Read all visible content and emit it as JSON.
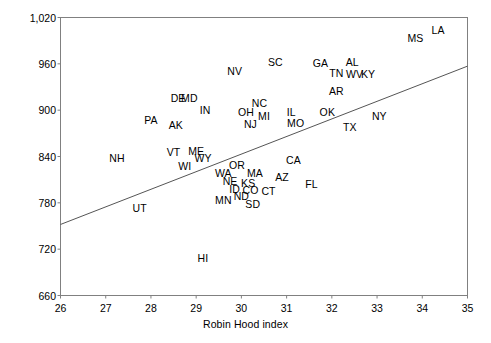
{
  "chart_data": {
    "type": "scatter",
    "title": "",
    "xlabel": "Robin Hood index",
    "ylabel": "Age-adjusted mortality rate",
    "xlim": [
      26,
      35
    ],
    "ylim": [
      660,
      1020
    ],
    "xticks": [
      26,
      27,
      28,
      29,
      30,
      31,
      32,
      33,
      34,
      35
    ],
    "yticks": [
      "660",
      "720",
      "780",
      "840",
      "900",
      "960",
      "1,020"
    ],
    "ytick_values": [
      660,
      720,
      780,
      840,
      900,
      960,
      1020
    ],
    "grid": false,
    "legend": null,
    "point_marker": "text-label",
    "trendline": {
      "visible": true,
      "x_start": 26,
      "y_start": 752,
      "x_end": 35,
      "y_end": 957,
      "color": "#555555"
    },
    "points": [
      {
        "label": "LA",
        "x": 34.35,
        "y": 1004
      },
      {
        "label": "MS",
        "x": 33.85,
        "y": 994
      },
      {
        "label": "AL",
        "x": 32.45,
        "y": 963
      },
      {
        "label": "NV",
        "x": 29.85,
        "y": 951
      },
      {
        "label": "SC",
        "x": 30.75,
        "y": 962
      },
      {
        "label": "GA",
        "x": 31.75,
        "y": 961
      },
      {
        "label": "TN",
        "x": 32.1,
        "y": 948
      },
      {
        "label": "WV",
        "x": 32.5,
        "y": 947
      },
      {
        "label": "KY",
        "x": 32.8,
        "y": 947
      },
      {
        "label": "DE",
        "x": 28.6,
        "y": 916
      },
      {
        "label": "MD",
        "x": 28.85,
        "y": 916
      },
      {
        "label": "NC",
        "x": 30.4,
        "y": 909
      },
      {
        "label": "AR",
        "x": 32.1,
        "y": 925
      },
      {
        "label": "IN",
        "x": 29.2,
        "y": 900
      },
      {
        "label": "OH",
        "x": 30.1,
        "y": 898
      },
      {
        "label": "MI",
        "x": 30.5,
        "y": 893
      },
      {
        "label": "IL",
        "x": 31.1,
        "y": 898
      },
      {
        "label": "OK",
        "x": 31.9,
        "y": 897
      },
      {
        "label": "NY",
        "x": 33.05,
        "y": 893
      },
      {
        "label": "PA",
        "x": 28.0,
        "y": 887
      },
      {
        "label": "AK",
        "x": 28.55,
        "y": 881
      },
      {
        "label": "NJ",
        "x": 30.2,
        "y": 882
      },
      {
        "label": "MO",
        "x": 31.2,
        "y": 883
      },
      {
        "label": "TX",
        "x": 32.4,
        "y": 878
      },
      {
        "label": "VT",
        "x": 28.5,
        "y": 846
      },
      {
        "label": "ME",
        "x": 29.0,
        "y": 847
      },
      {
        "label": "WY",
        "x": 29.15,
        "y": 838
      },
      {
        "label": "NH",
        "x": 27.25,
        "y": 838
      },
      {
        "label": "CA",
        "x": 31.15,
        "y": 835
      },
      {
        "label": "OR",
        "x": 29.9,
        "y": 829
      },
      {
        "label": "WI",
        "x": 28.75,
        "y": 828
      },
      {
        "label": "WA",
        "x": 29.6,
        "y": 819
      },
      {
        "label": "MA",
        "x": 30.3,
        "y": 819
      },
      {
        "label": "AZ",
        "x": 30.9,
        "y": 813
      },
      {
        "label": "NE",
        "x": 29.75,
        "y": 808
      },
      {
        "label": "KS",
        "x": 30.15,
        "y": 806
      },
      {
        "label": "FL",
        "x": 31.55,
        "y": 805
      },
      {
        "label": "ID",
        "x": 29.85,
        "y": 798
      },
      {
        "label": "CO",
        "x": 30.2,
        "y": 797
      },
      {
        "label": "CT",
        "x": 30.6,
        "y": 795
      },
      {
        "label": "ND",
        "x": 30.0,
        "y": 789
      },
      {
        "label": "MN",
        "x": 29.6,
        "y": 784
      },
      {
        "label": "SD",
        "x": 30.25,
        "y": 779
      },
      {
        "label": "UT",
        "x": 27.75,
        "y": 773
      },
      {
        "label": "HI",
        "x": 29.15,
        "y": 708
      }
    ]
  }
}
